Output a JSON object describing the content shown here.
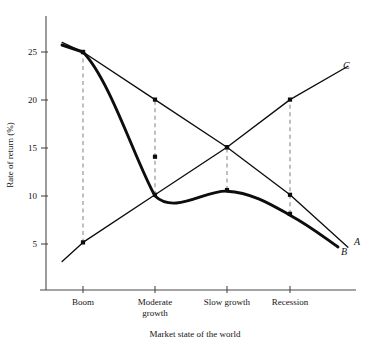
{
  "chart_data": {
    "type": "line",
    "title": "",
    "xlabel": "Market state of the world",
    "ylabel": "Rate of return (%)",
    "categories": [
      "Boom",
      "Moderate growth",
      "Slow growth",
      "Recession"
    ],
    "category_labels_multiline": [
      [
        "Boom"
      ],
      [
        "Moderate",
        "growth"
      ],
      [
        "Slow growth"
      ],
      [
        "Recession"
      ]
    ],
    "yticks": [
      5,
      10,
      15,
      20,
      25
    ],
    "ytick_labels": [
      "5",
      "10",
      "15",
      "20",
      "25"
    ],
    "ylim": [
      0,
      28
    ],
    "grid": false,
    "legend": "inline-endpoint-labels",
    "series": [
      {
        "name": "A",
        "label": "A",
        "style": "thin-straight",
        "values": [
          25,
          20,
          15,
          10
        ],
        "lead_in_value": 26,
        "lead_out_value": 4.5
      },
      {
        "name": "B",
        "label": "B",
        "style": "thick-curved",
        "values": [
          25,
          14,
          10.5,
          8
        ],
        "lead_in_value": 26,
        "lead_out_value": 4.8
      },
      {
        "name": "C",
        "label": "C",
        "style": "thin-straight",
        "values": [
          5,
          10,
          15,
          20
        ],
        "lead_in_value": 3,
        "lead_out_value": 23.5
      }
    ],
    "connectors": [
      {
        "category": "Boom",
        "from": 5,
        "to": 25
      },
      {
        "category": "Moderate growth",
        "from": 10,
        "to": 20
      },
      {
        "category": "Slow growth",
        "from": 10.5,
        "to": 15
      },
      {
        "category": "Recession",
        "from": 8,
        "to": 20
      }
    ],
    "annotations": []
  },
  "axis": {
    "y_title": "Rate of return (%)",
    "x_title": "Market state of the world"
  },
  "labels": {
    "series_a": "A",
    "series_b": "B",
    "series_c": "C",
    "y_5": "5",
    "y_10": "10",
    "y_15": "15",
    "y_20": "20",
    "y_25": "25",
    "cat_boom": "Boom",
    "cat_moderate_1": "Moderate",
    "cat_moderate_2": "growth",
    "cat_slow": "Slow growth",
    "cat_recession": "Recession"
  },
  "colors": {
    "line": "#0d0d0d",
    "axis": "#4a4a4a",
    "connector": "#8c8c8c",
    "background": "#ffffff"
  }
}
